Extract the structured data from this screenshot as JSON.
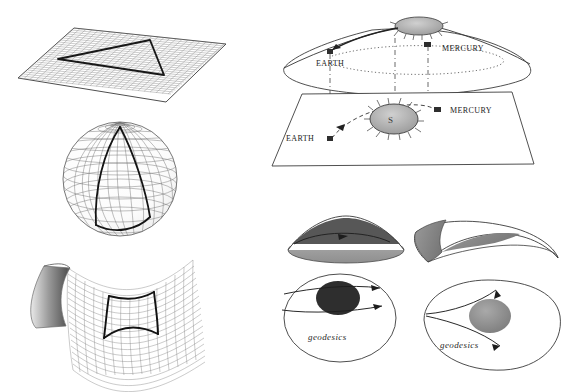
{
  "page": {
    "background": "#ffffff",
    "width": 580,
    "height": 392
  },
  "colors": {
    "ink": "#2b2b2b",
    "grid": "#7a7a7a",
    "grid_light": "#a8a8a8",
    "heavy": "#111111",
    "shade_dark": "#3a3a3a",
    "shade_mid": "#8c8c8c",
    "shade_light": "#c9c9c9",
    "background": "#ffffff"
  },
  "figures": [
    {
      "id": "flat-plane",
      "name": "flat-plane-with-triangle",
      "caption": "",
      "surface": "plane",
      "curvature": "zero",
      "annotation": "geodesic triangle on a flat plane"
    },
    {
      "id": "sphere",
      "name": "sphere-with-spherical-triangle",
      "caption": "",
      "surface": "sphere",
      "curvature": "positive",
      "annotation": "geodesic triangle on a sphere"
    },
    {
      "id": "saddle",
      "name": "saddle-with-geodesic-quadrilateral",
      "caption": "",
      "surface": "hyperboloid",
      "curvature": "negative",
      "annotation": "geodesic figure on a saddle surface"
    },
    {
      "id": "spacetime",
      "name": "spacetime-cone-and-plane-diagram",
      "caption": "",
      "annotation": "curved sheet above flat sheet showing orbits"
    },
    {
      "id": "converging",
      "name": "converging-geodesics-figure",
      "caption": "geodesics",
      "annotation": "geodesics converging around a dark mass"
    },
    {
      "id": "diverging",
      "name": "diverging-geodesics-figure",
      "caption": "geodesics",
      "annotation": "geodesics diverging around a gray mass"
    }
  ],
  "spacetime": {
    "upper_sheet": {
      "name": "curved-sheet",
      "labels": {
        "earth": "EARTH",
        "mercury": "MERCURY"
      },
      "body_sun": "S"
    },
    "lower_sheet": {
      "name": "flat-sheet",
      "labels": {
        "earth": "EARTH",
        "mercury": "MERCURY"
      },
      "body_sun": "S"
    }
  },
  "geodesic_panels": {
    "left": {
      "label": "geodesics",
      "mass_shade": "#2e2e2e",
      "arrows": 2
    },
    "right": {
      "label": "geodesics",
      "mass_shade": "#8e8e8e",
      "arrows": 2
    }
  },
  "shapes_row": {
    "left": {
      "name": "shaded-cone-surface"
    },
    "right": {
      "name": "shaded-saddle-surface"
    }
  }
}
